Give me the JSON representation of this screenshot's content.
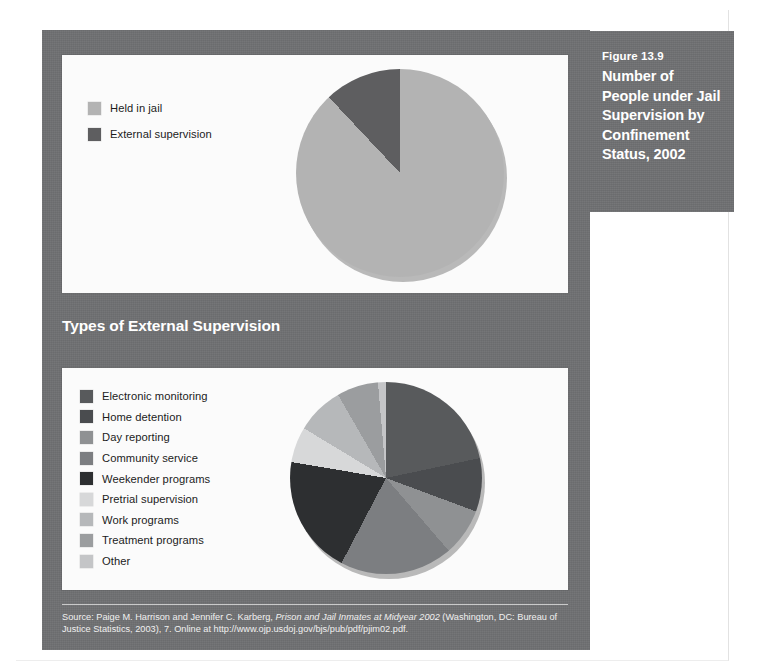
{
  "caption": {
    "figure_number": "Figure 13.9",
    "title": "Number of People under Jail Supervision by Confinement Status, 2002"
  },
  "section": {
    "heading": "Types of External Supervision"
  },
  "source": {
    "line1_prefix": "Source: Paige M. Harrison and Jennifer C. Karberg, ",
    "line1_italic": "Prison and Jail Inmates at Midyear 2002",
    "line1_suffix": " (Washington, DC: Bureau of Justice Statistics, 2003),",
    "line2": "7. Online at http://www.ojp.usdoj.gov/bjs/pub/pdf/pjim02.pdf."
  },
  "colors": {
    "panel_gray": "#6f7072",
    "card_white": "#fbfbfb",
    "caption_text": "#ffffff"
  },
  "chart_data": [
    {
      "type": "pie",
      "id": "confinement-status",
      "title": "Number of People under Jail Supervision by Confinement Status, 2002",
      "legend_position": "left",
      "labels": [
        "Held in jail",
        "External supervision"
      ],
      "values": [
        88,
        12
      ],
      "colors": [
        "#b3b3b3",
        "#5e5e60"
      ],
      "start_angle_deg": 0
    },
    {
      "type": "pie",
      "id": "types-of-external-supervision",
      "title": "Types of External Supervision",
      "legend_position": "left",
      "labels": [
        "Electronic monitoring",
        "Home detention",
        "Day reporting",
        "Community service",
        "Weekender programs",
        "Pretrial supervision",
        "Work programs",
        "Treatment programs",
        "Other"
      ],
      "values": [
        15,
        9,
        8,
        19,
        20,
        6,
        8,
        7,
        8
      ],
      "colors": [
        "#585a5c",
        "#4a4c4f",
        "#8f9193",
        "#7c7e81",
        "#2d2f31",
        "#d7d8d9",
        "#b6b8ba",
        "#9b9d9f",
        "#c4c5c7"
      ],
      "start_angle_deg": 24
    }
  ]
}
